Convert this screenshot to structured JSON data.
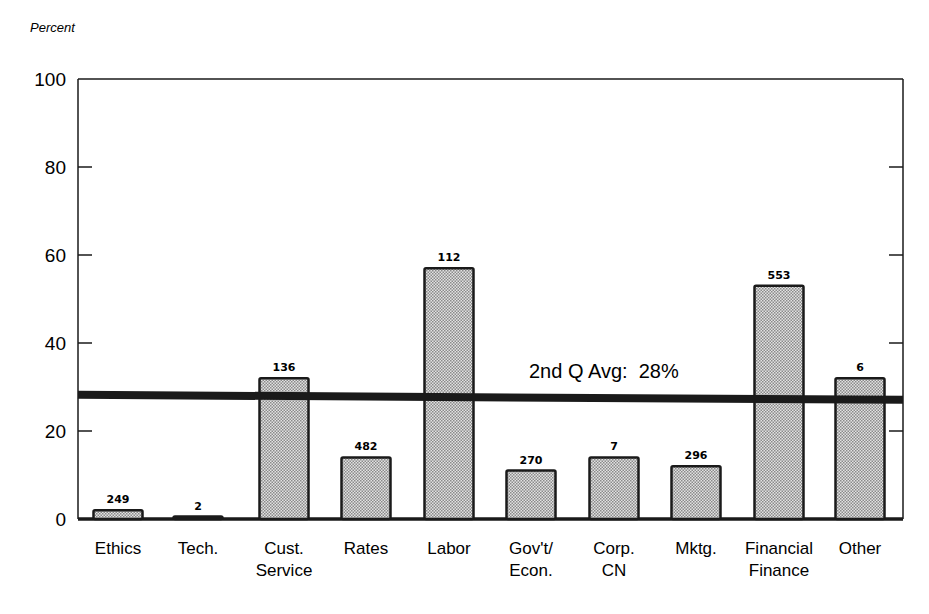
{
  "chart_data": {
    "type": "bar",
    "title": "",
    "ylabel": "Percent",
    "xlabel": "",
    "ylim": [
      0,
      100
    ],
    "yticks": [
      0,
      20,
      40,
      60,
      80,
      100
    ],
    "grid": false,
    "legend": null,
    "categories": [
      [
        "Ethics"
      ],
      [
        "Tech."
      ],
      [
        "Cust.",
        "Service"
      ],
      [
        "Rates"
      ],
      [
        "Labor"
      ],
      [
        "Gov't/",
        "Econ."
      ],
      [
        "Corp.",
        "CN"
      ],
      [
        "Mktg."
      ],
      [
        "Financial",
        "Finance"
      ],
      [
        "Other"
      ]
    ],
    "values": [
      2,
      0.5,
      32,
      14,
      57,
      11,
      14,
      12,
      53,
      32
    ],
    "bar_counts": [
      "249",
      "2",
      "136",
      "482",
      "112",
      "270",
      "7",
      "296",
      "553",
      "6"
    ],
    "reference_line": {
      "value": 28,
      "label": "2nd Q Avg:  28%"
    },
    "colors": {
      "bar_fill": "#c4c4c4",
      "bar_edge": "#1a1a1a",
      "line": "#1a1a1a"
    }
  }
}
